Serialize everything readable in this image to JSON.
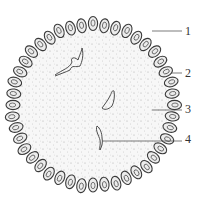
{
  "diagram": {
    "type": "biological cross-section (spherical colony)",
    "center": [
      93,
      105
    ],
    "radius": 80,
    "colors": {
      "outline": "#3a3a3a",
      "fill": "#f7f7f7",
      "stipple": "#9a9a9a",
      "cell_fill": "#ececec"
    },
    "labels": [
      {
        "id": 1,
        "text": "1",
        "x": 185,
        "y": 25,
        "line_from": [
          152,
          31
        ],
        "line_to": [
          182,
          31
        ]
      },
      {
        "id": 2,
        "text": "2",
        "x": 185,
        "y": 67,
        "line_from": [
          171,
          73
        ],
        "line_to": [
          182,
          73
        ]
      },
      {
        "id": 3,
        "text": "3",
        "x": 185,
        "y": 103,
        "line_from": [
          152,
          110
        ],
        "line_to": [
          182,
          110
        ]
      },
      {
        "id": 4,
        "text": "4",
        "x": 185,
        "y": 133,
        "line_from": [
          103,
          141
        ],
        "line_to": [
          182,
          141
        ]
      }
    ]
  }
}
